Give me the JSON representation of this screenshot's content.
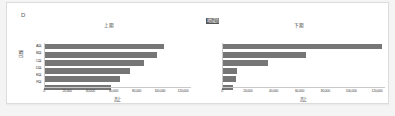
{
  "panel": {
    "corner_mark": "D",
    "legend_label": "地域別"
  },
  "chart_data": [
    {
      "type": "bar",
      "orientation": "horizontal",
      "title": "上期",
      "xlabel": "売上",
      "ylabel": "店舗",
      "categories": [
        "A店",
        "B店",
        "C店",
        "D店",
        "E店",
        "F店"
      ],
      "values": [
        98000,
        92000,
        82000,
        70000,
        62000,
        55000
      ],
      "xticks": [
        "0",
        "20,000",
        "40,000",
        "60,000",
        "80,000",
        "100,000",
        "120,000"
      ],
      "xlim": [
        0,
        120000
      ],
      "grid": false,
      "legend": "none",
      "bar_color": "#767676"
    },
    {
      "type": "bar",
      "orientation": "horizontal",
      "title": "下期",
      "xlabel": "売上",
      "ylabel": "店舗",
      "categories": [
        "A店",
        "B店",
        "C店",
        "D店",
        "E店",
        "F店"
      ],
      "values": [
        118000,
        62000,
        34000,
        11000,
        10000,
        8000
      ],
      "xticks": [
        "0",
        "20,000",
        "40,000",
        "60,000",
        "80,000",
        "100,000",
        "120,000"
      ],
      "xlim": [
        0,
        120000
      ],
      "grid": false,
      "legend": "none",
      "bar_color": "#767676"
    }
  ]
}
